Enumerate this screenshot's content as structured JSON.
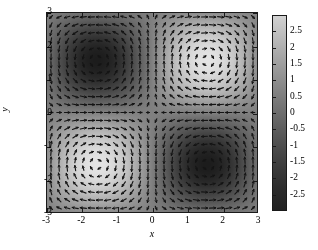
{
  "chart_data": {
    "type": "heatmap",
    "title": "",
    "subtitle": "",
    "xlabel": "x",
    "ylabel": "y",
    "xlim": [
      -3,
      3
    ],
    "ylim": [
      -3,
      3
    ],
    "grid": false,
    "legend_position": "none",
    "overlay": "quiver",
    "colormap": "gray",
    "clim": [
      -3,
      3
    ],
    "field_description": "Periodic scalar field rendered in grayscale with an overlaid vector (quiver) field of short dark line segments; alternating bright maxima and dark minima arranged on a lattice of period pi in both x and y.",
    "scalar_function": "3*sin(x)*sin(y)",
    "vector_function": "gradient-like rotational field tangent to the scalar contours",
    "x_ticks": [
      -3,
      -2,
      -1,
      0,
      1,
      2,
      3
    ],
    "x_tick_labels": [
      "-3",
      "-2",
      "-1",
      "0",
      "1",
      "2",
      "3"
    ],
    "y_ticks": [
      -3,
      -2,
      -1,
      0,
      1,
      2,
      3
    ],
    "y_tick_labels": [
      "-3",
      "-2",
      "-1",
      "0",
      "1",
      "2",
      "3"
    ],
    "colorbar": {
      "orientation": "vertical",
      "ticks": [
        2.5,
        2,
        1.5,
        1,
        0.5,
        0,
        -0.5,
        -1,
        -1.5,
        -2,
        -2.5
      ],
      "tick_labels": [
        "2.5",
        "2",
        "1.5",
        "1",
        "0.5",
        "0",
        "-0.5",
        "-1",
        "-1.5",
        "-2",
        "-2.5"
      ],
      "range_min": -3,
      "range_max": 3,
      "top_color": "#d2d2d2",
      "bottom_color": "#222222"
    },
    "quiver": {
      "grid_nx": 26,
      "grid_ny": 25,
      "arrow_color": "#141414",
      "arrow_style": "short line segment with small head"
    }
  },
  "figure": {
    "background": "#ffffff",
    "axes_line_color": "#1a1a1a"
  }
}
